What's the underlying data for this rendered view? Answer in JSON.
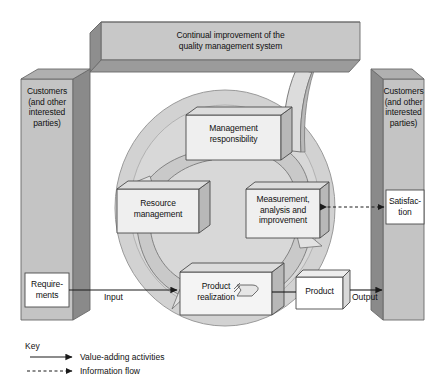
{
  "diagram": {
    "banner": {
      "line1": "Continual improvement of the",
      "line2": "quality management system",
      "text": "Continual improvement of the\nquality management system"
    },
    "pillars": [
      {
        "id": "customers-left",
        "side": "left",
        "text": "Customers\n(and other\ninterested\nparties)",
        "box": {
          "id": "requirements",
          "text": "Requirements",
          "display": "Require-\nments"
        }
      },
      {
        "id": "customers-right",
        "side": "right",
        "text": "Customers\n(and other\ninterested\nparties)",
        "box": {
          "id": "satisfaction",
          "text": "Satisfaction",
          "display": "Satisfac-\ntion"
        }
      }
    ],
    "processes": [
      {
        "id": "management-responsibility",
        "text": "Management\nresponsibility"
      },
      {
        "id": "resource-management",
        "text": "Resource\nmanagement"
      },
      {
        "id": "measurement-analysis-improvement",
        "text": "Measurement,\nanalysis and\nimprovement"
      },
      {
        "id": "product-realization",
        "text": "Product\nrealization"
      }
    ],
    "product_box": {
      "id": "product",
      "text": "Product"
    },
    "flow_labels": {
      "input": "Input",
      "output": "Output"
    },
    "legend": {
      "title": "Key",
      "items": [
        {
          "id": "value-adding",
          "label": "Value-adding activities",
          "style": "solid"
        },
        {
          "id": "information-flow",
          "label": "Information flow",
          "style": "dashed"
        }
      ]
    },
    "colors": {
      "banner_fill": "#c8c8c8",
      "banner_side": "#8e8e8e",
      "pillar_fill": "#c4c4c4",
      "pillar_side": "#8a8a8a",
      "circle_fill": "#d2d2d2",
      "box_fill": "#efefef",
      "box_side": "#b8b8b8",
      "white_box": "#ffffff",
      "stroke": "#555555",
      "text": "#111111"
    }
  }
}
